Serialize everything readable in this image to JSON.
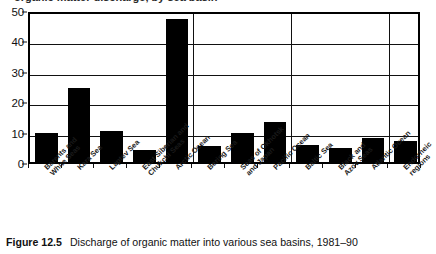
{
  "top_partial_heading": "organic matter discharge, by sea basin",
  "caption": {
    "label": "Figure 12.5",
    "text": "Discharge of organic matter into various sea basins, 1981–90"
  },
  "chart_data": {
    "type": "bar",
    "title": "Discharge of organic matter into various sea basins, 1981–90",
    "xlabel": "",
    "ylabel": "",
    "ylim": [
      0,
      50
    ],
    "yticks": [
      0,
      10,
      20,
      30,
      40,
      50
    ],
    "grid": true,
    "legend": false,
    "bar_color": "#000000",
    "categories": [
      "Barents and White Seas",
      "Kara Sea",
      "Laptev Sea",
      "East Siberian and Chukchi Seas",
      "Arctic Ocean",
      "Bering Sea",
      "Seas of Okhotsk and Japan",
      "Pacific Ocean",
      "Baltic Sea",
      "Black and Azov Seas",
      "Atlantic Ocean",
      "Endorheic regions"
    ],
    "category_lines": [
      [
        "Barents and",
        "White Seas"
      ],
      [
        "Kara Sea"
      ],
      [
        "Laptev Sea"
      ],
      [
        "East Siberian and",
        "Chukchi Seas"
      ],
      [
        "Arctic Ocean"
      ],
      [
        "Bering Sea"
      ],
      [
        "Seas of Okhotsk",
        "and Japan"
      ],
      [
        "Pacific Ocean"
      ],
      [
        "Baltic Sea"
      ],
      [
        "Black and",
        "Azov Seas"
      ],
      [
        "Atlantic Ocean"
      ],
      [
        "Endorheic",
        "regions"
      ]
    ],
    "values": [
      9.5,
      24.5,
      10.3,
      4.0,
      47.0,
      5.2,
      9.4,
      13.1,
      5.5,
      4.7,
      7.8,
      7.0
    ],
    "group_dividers_after": [
      4,
      7,
      10
    ]
  }
}
